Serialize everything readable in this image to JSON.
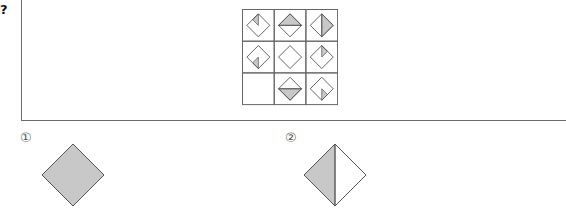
{
  "question": {
    "marker": "?",
    "grid": {
      "rows": 3,
      "cols": 3,
      "cells": [
        {
          "row": 0,
          "col": 0,
          "shape": "diamond",
          "shaded": "top-left-small-triangle",
          "empty": false
        },
        {
          "row": 0,
          "col": 1,
          "shape": "diamond",
          "shaded": "top-half",
          "empty": false
        },
        {
          "row": 0,
          "col": 2,
          "shape": "diamond",
          "shaded": "right-half",
          "empty": false
        },
        {
          "row": 1,
          "col": 0,
          "shape": "diamond",
          "shaded": "bottom-left-small-triangle",
          "empty": false
        },
        {
          "row": 1,
          "col": 1,
          "shape": "diamond",
          "shaded": "none",
          "empty": false
        },
        {
          "row": 1,
          "col": 2,
          "shape": "diamond",
          "shaded": "top-right-small-triangle",
          "empty": false
        },
        {
          "row": 2,
          "col": 0,
          "shape": "none",
          "shaded": "none",
          "empty": true
        },
        {
          "row": 2,
          "col": 1,
          "shape": "diamond",
          "shaded": "bottom-half",
          "empty": false
        },
        {
          "row": 2,
          "col": 2,
          "shape": "diamond",
          "shaded": "bottom-right-small-triangle",
          "empty": false
        }
      ]
    }
  },
  "options": [
    {
      "label": "①",
      "shape": "diamond",
      "shaded": "full"
    },
    {
      "label": "②",
      "shape": "diamond",
      "shaded": "left-half"
    }
  ],
  "colors": {
    "shade": "#c8c8c8",
    "stroke": "#555555",
    "grid_line": "#666666"
  }
}
